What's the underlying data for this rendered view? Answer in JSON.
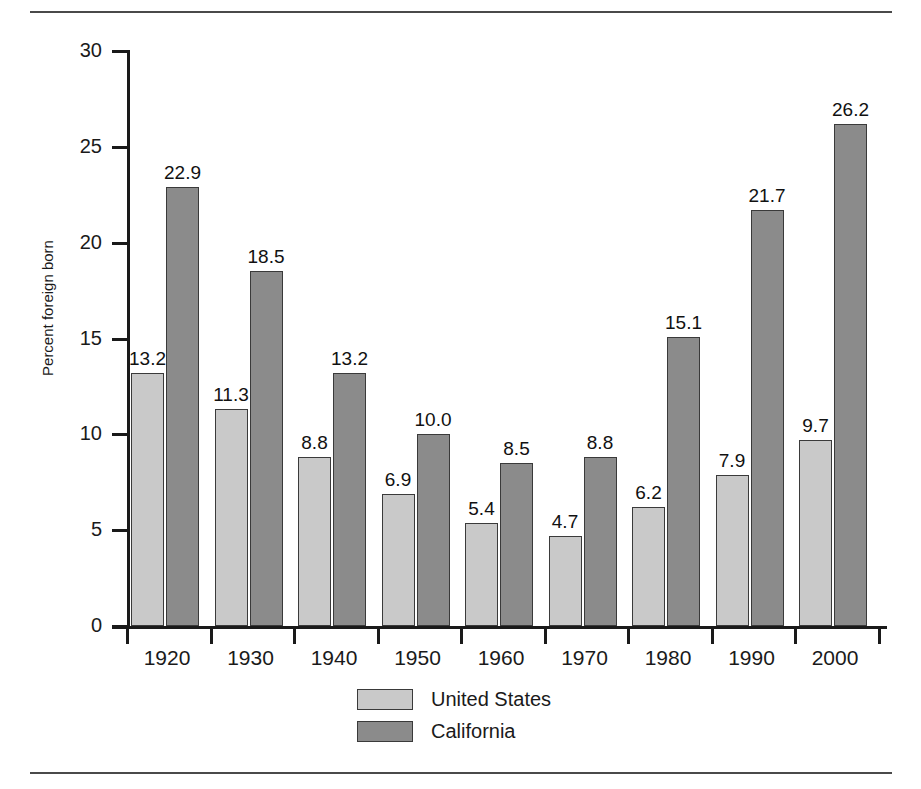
{
  "chart_data": {
    "type": "bar",
    "title": "",
    "xlabel": "",
    "ylabel": "Percent foreign born",
    "categories": [
      "1920",
      "1930",
      "1940",
      "1950",
      "1960",
      "1970",
      "1980",
      "1990",
      "2000"
    ],
    "series": [
      {
        "name": "United States",
        "color": "#c9c9c9",
        "values": [
          13.2,
          11.3,
          8.8,
          6.9,
          5.4,
          4.7,
          6.2,
          7.9,
          9.7
        ]
      },
      {
        "name": "California",
        "color": "#8b8b8b",
        "values": [
          22.9,
          18.5,
          13.2,
          10.0,
          8.5,
          8.8,
          15.1,
          21.7,
          26.2
        ]
      }
    ],
    "ylim": [
      0,
      30
    ],
    "yticks": [
      "0",
      "5",
      "10",
      "15",
      "20",
      "25",
      "30"
    ],
    "ytick_values": [
      0,
      5,
      10,
      15,
      20,
      25,
      30
    ],
    "grid": false,
    "legend_position": "bottom-center",
    "value_labels": true,
    "value_label_format": "one-decimal"
  },
  "legend": {
    "entries": [
      {
        "label": "United States",
        "color": "#c9c9c9"
      },
      {
        "label": "California",
        "color": "#8b8b8b"
      }
    ]
  },
  "axis": {
    "y_title": "Percent foreign born"
  }
}
